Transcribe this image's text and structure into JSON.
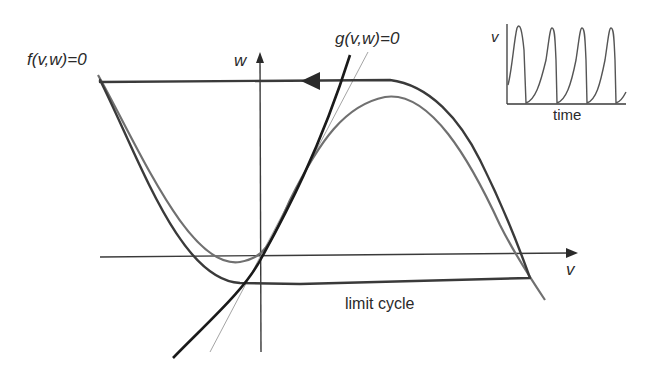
{
  "labels": {
    "f_nullcline": "f(v,w)=0",
    "g_nullcline": "g(v,w)=0",
    "w_axis": "w",
    "v_axis": "v",
    "limit_cycle": "limit cycle",
    "inset_v_axis": "v",
    "inset_time_axis": "time"
  },
  "colors": {
    "limit_cycle": "#3a3a3a",
    "f_nullcline": "#707070",
    "g_nullcline": "#1a1a1a",
    "tangent_line": "#9a9a9a",
    "axes": "#3a3a3a",
    "inset_trace": "#555555",
    "text": "#2a2a2a"
  },
  "inset": {
    "title": "voltage time course",
    "xlabel": "time",
    "ylabel": "v",
    "spike_count": 4
  }
}
